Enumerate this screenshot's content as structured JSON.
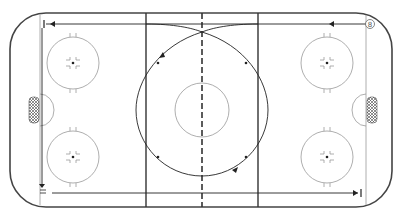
{
  "diagram": {
    "type": "hockey-rink-drill",
    "colors": {
      "boards": "#444444",
      "lines": "#333333",
      "circles": "#999999",
      "path": "#222222",
      "background": "#ffffff"
    },
    "markers": {
      "start_label": "8"
    },
    "elements": [
      "rink-boards",
      "goal-line-left",
      "goal-line-right",
      "blue-line-left",
      "blue-line-right",
      "center-red-line",
      "center-circle",
      "faceoff-circles-4",
      "neutral-zone-dots-4",
      "goal-creases-2",
      "goal-nets-2",
      "skater-path"
    ]
  }
}
